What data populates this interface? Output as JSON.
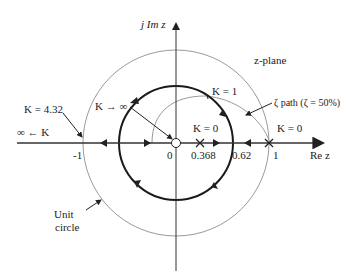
{
  "plane_label": "z-plane",
  "axes": {
    "imag_label": "j Im z",
    "real_label": "Re z",
    "ticks": [
      "-1",
      "0",
      "0.368",
      "0.62",
      "1"
    ]
  },
  "annotations": {
    "k_432": "K = 4.32",
    "k_inf_left": "∞ ← K",
    "k_to_inf": "K → ∞",
    "k_1": "K = 1",
    "k_0_inner": "K = 0",
    "k_0_outer": "K = 0",
    "zeta_path": "ζ path (ζ = 50%)",
    "unit_circle_line1": "Unit",
    "unit_circle_line2": "circle"
  },
  "markers": {
    "zero_at": "0 (circle)",
    "poles_at": [
      "0.368 (x)",
      "1 (x)"
    ]
  },
  "colors": {
    "locus": "#1a1a1a",
    "unit_circle": "#9a9a9a",
    "zeta_path": "#9a9a9a",
    "axes": "#333333"
  }
}
